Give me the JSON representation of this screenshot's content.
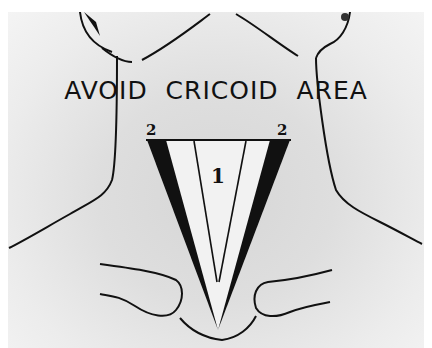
{
  "figure": {
    "caption": "AVOID  CRICOID  AREA",
    "zone_labels": {
      "center": "1",
      "left_edge": "2",
      "right_edge": "2"
    },
    "colors": {
      "background": "#dcdcdc",
      "ink": "#111111",
      "zone_fill": "#f2f2f2"
    }
  }
}
